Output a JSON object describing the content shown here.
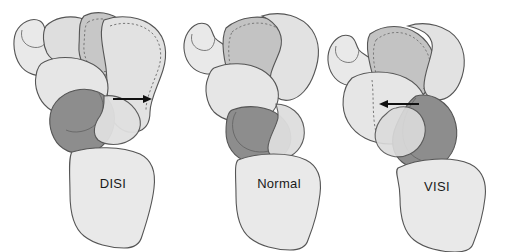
{
  "figure": {
    "background_color": "#ffffff",
    "panel_count": 3
  },
  "style": {
    "outline_color": "#555555",
    "dotted_outline_color": "#777777",
    "fill_light": "#e4e4e4",
    "fill_lighter": "#ededed",
    "fill_medium": "#c9c9c9",
    "fill_dark": "#8d8d8d",
    "arrow_color": "#111111",
    "label_color": "#1a1a1a"
  },
  "panels": [
    {
      "id": "disi",
      "label": "DISI",
      "label_x": 113,
      "label_y": 188,
      "arrow": {
        "name": "dorsal-displacement-arrow",
        "direction": "right",
        "x1": 113,
        "y1": 99,
        "x2": 152,
        "y2": 99
      }
    },
    {
      "id": "normal",
      "label": "Normal",
      "label_x": 279,
      "label_y": 188,
      "arrow": null
    },
    {
      "id": "visi",
      "label": "VISI",
      "label_x": 437,
      "label_y": 191,
      "arrow": {
        "name": "volar-displacement-arrow",
        "direction": "left",
        "x1": 419,
        "y1": 104,
        "x2": 379,
        "y2": 104
      }
    }
  ]
}
